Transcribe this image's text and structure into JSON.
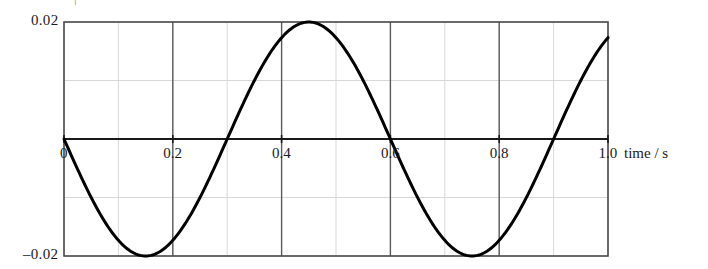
{
  "chart_data": {
    "type": "line",
    "title": "",
    "subtitle": "",
    "xlabel": "time / s",
    "ylabel": "",
    "xlim": [
      0,
      1.0
    ],
    "ylim": [
      -0.02,
      0.02
    ],
    "grid": true,
    "grid_major_x_step": 0.2,
    "grid_minor_x_step": 0.1,
    "grid_major_y_step": 0.02,
    "grid_minor_y_step": 0.01,
    "legend": null,
    "legend_position": "none",
    "x_ticks": [
      {
        "value": 0,
        "label": "0"
      },
      {
        "value": 0.2,
        "label": "0.2"
      },
      {
        "value": 0.4,
        "label": "0.4"
      },
      {
        "value": 0.6,
        "label": "0.6"
      },
      {
        "value": 0.8,
        "label": "0.8"
      },
      {
        "value": 1.0,
        "label": "1.0"
      }
    ],
    "y_ticks": [
      {
        "value": 0.02,
        "label": "0.02"
      },
      {
        "value": -0.02,
        "label": "–0.02"
      }
    ],
    "series": [
      {
        "name": "displacement",
        "color": "#000000",
        "line_width": 3,
        "description": "sinusoid, amplitude 0.02, period 0.6 s, starts at zero going negative",
        "amplitude": 0.02,
        "period": 0.6,
        "phase": "negative-sine",
        "x": [
          0,
          0.02,
          0.04,
          0.06,
          0.08,
          0.1,
          0.12,
          0.14,
          0.15,
          0.16,
          0.18,
          0.2,
          0.22,
          0.24,
          0.26,
          0.28,
          0.3,
          0.32,
          0.34,
          0.36,
          0.38,
          0.4,
          0.42,
          0.44,
          0.45,
          0.46,
          0.48,
          0.5,
          0.52,
          0.54,
          0.56,
          0.58,
          0.6,
          0.62,
          0.64,
          0.66,
          0.68,
          0.7,
          0.72,
          0.74,
          0.75,
          0.76,
          0.78,
          0.8,
          0.82,
          0.84,
          0.86,
          0.88,
          0.9,
          0.92,
          0.94,
          0.96,
          0.98,
          1.0
        ],
        "y": [
          0,
          -0.00415,
          -0.0081,
          -0.01169,
          -0.01476,
          -0.01717,
          -0.01883,
          -0.01967,
          -0.02,
          -0.01967,
          -0.01883,
          -0.01717,
          -0.01476,
          -0.01169,
          -0.0081,
          -0.00415,
          0,
          0.00415,
          0.0081,
          0.01169,
          0.01476,
          0.01717,
          0.01883,
          0.01967,
          0.02,
          0.01967,
          0.01883,
          0.01717,
          0.01476,
          0.01169,
          0.0081,
          0.00415,
          0,
          -0.00415,
          -0.0081,
          -0.01169,
          -0.01476,
          -0.01717,
          -0.01883,
          -0.01967,
          -0.02,
          -0.01967,
          -0.01883,
          -0.01717,
          -0.01476,
          -0.01169,
          -0.0081,
          -0.00415,
          0,
          0.00415,
          0.0081,
          0.01169,
          0.01476,
          0.01717
        ]
      }
    ],
    "zero_line": {
      "value": 0,
      "color": "#1a1a1a"
    },
    "frame_color": "#4a4a4a",
    "major_grid_color": "#5a5a5a",
    "minor_grid_color": "#d8d8d8"
  },
  "axis": {
    "x_unit_label": "time / s"
  },
  "artifact": {
    "clipped_mark": "|"
  }
}
